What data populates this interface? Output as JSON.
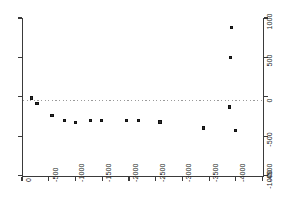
{
  "chart_data": {
    "type": "scatter",
    "title": "",
    "subtitle": "",
    "xlabel": "",
    "ylabel": "",
    "xlim": [
      0,
      -4500
    ],
    "ylim": [
      -1000,
      1000
    ],
    "x_ticks": [
      0,
      -500,
      -1000,
      -1500,
      -2000,
      -2500,
      -3000,
      -3500,
      -4000,
      -4500
    ],
    "x_tick_labels": [
      "0",
      "-500",
      "-1000",
      "-1500",
      "-2000",
      "-2500",
      "-3000",
      "-3500",
      "-4000",
      "-4500"
    ],
    "y_ticks": [
      1000,
      500,
      0,
      -500,
      -1000
    ],
    "y_tick_labels": [
      "1000",
      "500",
      "0",
      "-500",
      "-1000"
    ],
    "y_axis_position": "right",
    "x_axis_position": "bottom",
    "x_tick_label_rotation": -90,
    "y_tick_label_rotation": -90,
    "grid": false,
    "legend": null,
    "annotations": [],
    "reference_lines": [
      {
        "orientation": "horizontal",
        "value": 0,
        "style": "dotted",
        "color": "#9a9a9a"
      }
    ],
    "marker": {
      "shape": "square",
      "size": 3,
      "color": "#2e2e2e"
    },
    "series": [
      {
        "name": "series-1",
        "points": [
          {
            "x": -175,
            "y": -15
          },
          {
            "x": -280,
            "y": -90
          },
          {
            "x": -560,
            "y": -235
          },
          {
            "x": -800,
            "y": -300
          },
          {
            "x": -1000,
            "y": -330
          },
          {
            "x": -1280,
            "y": -305
          },
          {
            "x": -1480,
            "y": -305
          },
          {
            "x": -1960,
            "y": -300
          },
          {
            "x": -2180,
            "y": -300
          },
          {
            "x": -2580,
            "y": -320
          },
          {
            "x": -3400,
            "y": -395
          },
          {
            "x": -3880,
            "y": -130
          },
          {
            "x": -3900,
            "y": 500
          },
          {
            "x": -3920,
            "y": 875
          },
          {
            "x": -4000,
            "y": -430
          }
        ]
      }
    ]
  }
}
